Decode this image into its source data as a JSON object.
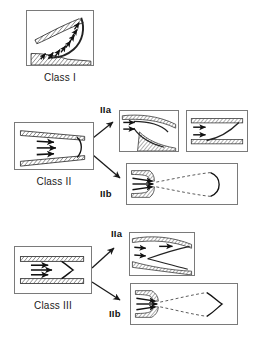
{
  "figure": {
    "background_color": "#ffffff",
    "line_color": "#1a1a1a",
    "panel_border_color": "#7a7a7a",
    "hatch_color": "#555555"
  },
  "captions": {
    "class1": "Class I",
    "class2": "Class II",
    "class3": "Class III"
  },
  "sublabels": {
    "class2_IIa": "IIa",
    "class2_IIb": "IIb",
    "class3_IIa": "IIa",
    "class3_IIb": "IIb"
  },
  "panels": [
    {
      "name": "class1-panel",
      "caption": "Class I",
      "description": "Curved channel with dense inward-pointing arrows along a hatched boundary"
    },
    {
      "name": "class2-panel",
      "caption": "Class II",
      "description": "Converging hatched walls with three arrows and a convex rounded front"
    },
    {
      "name": "class2-IIa-panel-1",
      "caption": "IIa",
      "description": "Curved hatched walls with two arrows entering a narrowed throat"
    },
    {
      "name": "class2-IIa-panel-2",
      "caption": "IIa",
      "description": "Parallel hatched walls with two arrows and a diagonal line"
    },
    {
      "name": "class2-IIb-panel",
      "caption": "IIb",
      "description": "Narrow orifice with three arrows, dashed divergent lines and rounded jet front"
    },
    {
      "name": "class3-panel",
      "caption": "Class III",
      "description": "Parallel hatched walls with three arrows and a pointed V-shaped front"
    },
    {
      "name": "class3-IIa-panel",
      "caption": "IIa",
      "description": "Curved hatched walls with three arrows splitting around a curved divider"
    },
    {
      "name": "class3-IIb-panel",
      "caption": "IIb",
      "description": "Narrow orifice with three arrows, dashed lines and pointed jet front"
    }
  ]
}
